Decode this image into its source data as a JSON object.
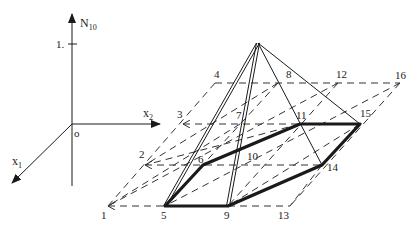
{
  "figure": {
    "axes": {
      "vertical_label": "N",
      "vertical_sub": "10",
      "tick_label": "1.",
      "origin_label": "o",
      "x1_label": "x",
      "x1_sub": "1",
      "x2_label": "x",
      "x2_sub": "2"
    },
    "origin": [
      72,
      124
    ],
    "apex": [
      258,
      43
    ],
    "grid_points": [
      {
        "id": "1",
        "label": "1",
        "xy": [
          108,
          206
        ],
        "label_xy": [
          101,
          219
        ]
      },
      {
        "id": "2",
        "label": "2",
        "xy": [
          145,
          165
        ],
        "label_xy": [
          139,
          158
        ]
      },
      {
        "id": "3",
        "label": "3",
        "xy": [
          183,
          124
        ],
        "label_xy": [
          177,
          118
        ]
      },
      {
        "id": "4",
        "label": "4",
        "xy": [
          215,
          83
        ],
        "label_xy": [
          214,
          78
        ]
      },
      {
        "id": "5",
        "label": "5",
        "xy": [
          165,
          206
        ],
        "label_xy": [
          161,
          219
        ]
      },
      {
        "id": "6",
        "label": "6",
        "xy": [
          203,
          165
        ],
        "label_xy": [
          198,
          163
        ]
      },
      {
        "id": "7",
        "label": "7",
        "xy": [
          240,
          124
        ],
        "label_xy": [
          236,
          119
        ]
      },
      {
        "id": "8",
        "label": "8",
        "xy": [
          278,
          83
        ],
        "label_xy": [
          286,
          78
        ]
      },
      {
        "id": "9",
        "label": "9",
        "xy": [
          228,
          206
        ],
        "label_xy": [
          224,
          219
        ]
      },
      {
        "id": "10",
        "label": "10",
        "xy": [
          262,
          165
        ],
        "label_xy": [
          247,
          160
        ]
      },
      {
        "id": "11",
        "label": "11",
        "xy": [
          300,
          124
        ],
        "label_xy": [
          296,
          119
        ]
      },
      {
        "id": "12",
        "label": "12",
        "xy": [
          338,
          83
        ],
        "label_xy": [
          336,
          78
        ]
      },
      {
        "id": "13",
        "label": "13",
        "xy": [
          290,
          206
        ],
        "label_xy": [
          278,
          219
        ]
      },
      {
        "id": "14",
        "label": "14",
        "xy": [
          322,
          165
        ],
        "label_xy": [
          327,
          171
        ]
      },
      {
        "id": "15",
        "label": "15",
        "xy": [
          360,
          124
        ],
        "label_xy": [
          360,
          117
        ]
      },
      {
        "id": "16",
        "label": "16",
        "xy": [
          400,
          83
        ],
        "label_xy": [
          395,
          79
        ]
      }
    ],
    "pyramid_base_polygon": [
      "5",
      "9",
      "14",
      "15",
      "11",
      "6"
    ],
    "pyramid_edges_from_apex": [
      "5",
      "9",
      "14",
      "15"
    ],
    "double_edges_from_apex": [
      "5",
      "9"
    ],
    "colors": {
      "line": "#1a1a1a",
      "dashed": "#333333",
      "background": "#ffffff"
    }
  }
}
